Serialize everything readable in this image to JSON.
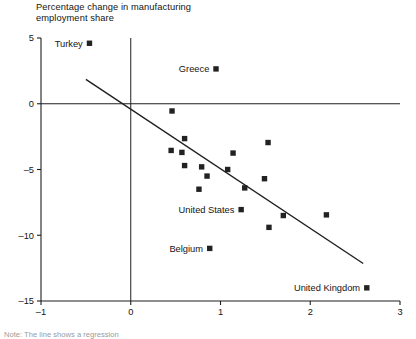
{
  "chart_data": {
    "type": "scatter",
    "title": "Percentage change in manufacturing\nemployment share",
    "xlabel": "",
    "ylabel": "",
    "xlim": [
      -1,
      3
    ],
    "ylim": [
      -15,
      5
    ],
    "xticks": [
      "-1",
      "0",
      "1",
      "2",
      "3"
    ],
    "xtick_values": [
      -1,
      0,
      1,
      2,
      3
    ],
    "yticks": [
      "5",
      "0",
      "-5",
      "-10",
      "-15"
    ],
    "ytick_values": [
      5,
      0,
      -5,
      -10,
      -15
    ],
    "grid": false,
    "legend": "none",
    "reference_lines": [
      {
        "name": "zero-horizontal",
        "orientation": "horizontal",
        "value": 0
      },
      {
        "name": "zero-vertical",
        "orientation": "vertical",
        "value": 0
      }
    ],
    "trendline": {
      "name": "regression-line",
      "x_start": -0.5,
      "y_start": 1.85,
      "x_end": 2.59,
      "y_end": -12.15
    },
    "points": [
      {
        "label": "Turkey",
        "label_pos": "left",
        "x": -0.46,
        "y": 4.6
      },
      {
        "label": "Greece",
        "label_pos": "left",
        "x": 0.95,
        "y": 2.65
      },
      {
        "label": "",
        "label_pos": "none",
        "x": 0.46,
        "y": -0.55
      },
      {
        "label": "",
        "label_pos": "none",
        "x": 0.6,
        "y": -2.65
      },
      {
        "label": "",
        "label_pos": "none",
        "x": 0.45,
        "y": -3.55
      },
      {
        "label": "",
        "label_pos": "none",
        "x": 0.57,
        "y": -3.7
      },
      {
        "label": "",
        "label_pos": "none",
        "x": 1.14,
        "y": -3.75
      },
      {
        "label": "",
        "label_pos": "none",
        "x": 1.53,
        "y": -2.95
      },
      {
        "label": "",
        "label_pos": "none",
        "x": 0.6,
        "y": -4.7
      },
      {
        "label": "",
        "label_pos": "none",
        "x": 0.79,
        "y": -4.8
      },
      {
        "label": "",
        "label_pos": "none",
        "x": 1.08,
        "y": -5.0
      },
      {
        "label": "",
        "label_pos": "none",
        "x": 0.85,
        "y": -5.5
      },
      {
        "label": "",
        "label_pos": "none",
        "x": 1.49,
        "y": -5.7
      },
      {
        "label": "",
        "label_pos": "none",
        "x": 0.76,
        "y": -6.5
      },
      {
        "label": "",
        "label_pos": "none",
        "x": 1.27,
        "y": -6.4
      },
      {
        "label": "United States",
        "label_pos": "left",
        "x": 1.23,
        "y": -8.05
      },
      {
        "label": "",
        "label_pos": "none",
        "x": 1.7,
        "y": -8.5
      },
      {
        "label": "",
        "label_pos": "none",
        "x": 2.18,
        "y": -8.45
      },
      {
        "label": "",
        "label_pos": "none",
        "x": 1.54,
        "y": -9.4
      },
      {
        "label": "Belgium",
        "label_pos": "left",
        "x": 0.88,
        "y": -11.0
      },
      {
        "label": "United Kingdom",
        "label_pos": "left",
        "x": 2.63,
        "y": -14.0
      }
    ]
  },
  "footnote": "Note: The line shows a regression"
}
